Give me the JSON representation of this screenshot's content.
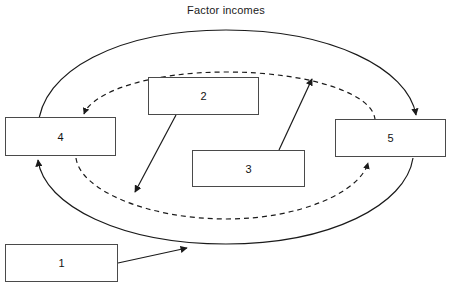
{
  "diagram": {
    "title": "Factor incomes",
    "background_color": "#ffffff",
    "line_color": "#1a1a1a",
    "box_border_color": "#4a4a4a",
    "box_fill_color": "#ffffff",
    "boxes": [
      {
        "id": "box-1",
        "label": "1"
      },
      {
        "id": "box-2",
        "label": "2"
      },
      {
        "id": "box-3",
        "label": "3"
      },
      {
        "id": "box-4",
        "label": "4"
      },
      {
        "id": "box-5",
        "label": "5"
      }
    ],
    "flows": {
      "outer_loop_style": "solid",
      "inner_loop_style": "dashed"
    }
  }
}
